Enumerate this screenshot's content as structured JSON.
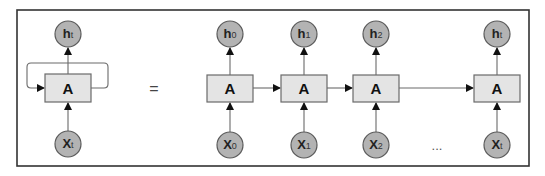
{
  "diagram": {
    "title": "",
    "equals_symbol": "=",
    "ellipsis": "...",
    "colors": {
      "frame": "#333333",
      "cell_fill": "#e4e4e4",
      "node_fill": "#b3b3b3",
      "edge": "#6a6a6a"
    },
    "folded": {
      "cell": {
        "label": "A"
      },
      "output": {
        "main": "h",
        "sub": "t"
      },
      "input": {
        "main": "X",
        "sub": "t"
      }
    },
    "unrolled": [
      {
        "cell": "A",
        "output_main": "h",
        "output_sub": "0",
        "input_main": "X",
        "input_sub": "0"
      },
      {
        "cell": "A",
        "output_main": "h",
        "output_sub": "1",
        "input_main": "X",
        "input_sub": "1"
      },
      {
        "cell": "A",
        "output_main": "h",
        "output_sub": "2",
        "input_main": "X",
        "input_sub": "2"
      },
      {
        "cell": "A",
        "output_main": "h",
        "output_sub": "t",
        "input_main": "X",
        "input_sub": "t"
      }
    ]
  }
}
